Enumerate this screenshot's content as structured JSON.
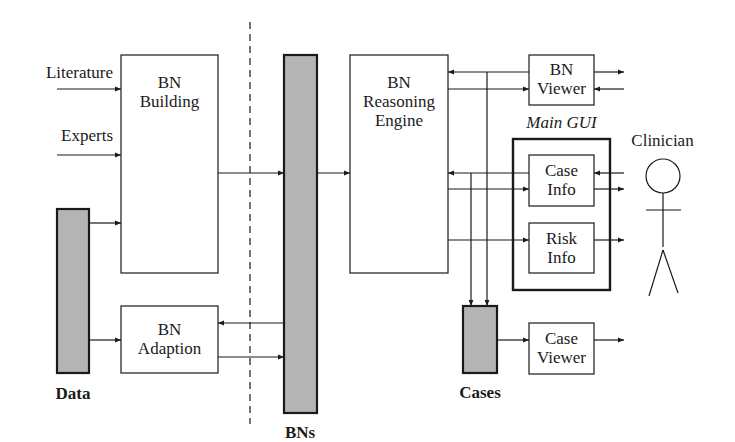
{
  "inputs": {
    "literature": "Literature",
    "experts": "Experts"
  },
  "stores": {
    "data": "Data",
    "bns": "BNs",
    "cases": "Cases"
  },
  "modules": {
    "bn_building": {
      "line1": "BN",
      "line2": "Building"
    },
    "bn_adaption": {
      "line1": "BN",
      "line2": "Adaption"
    },
    "bn_reasoning_engine": {
      "line1": "BN",
      "line2": "Reasoning",
      "line3": "Engine"
    },
    "bn_viewer": {
      "line1": "BN",
      "line2": "Viewer"
    },
    "case_info": {
      "line1": "Case",
      "line2": "Info"
    },
    "risk_info": {
      "line1": "Risk",
      "line2": "Info"
    },
    "case_viewer": {
      "line1": "Case",
      "line2": "Viewer"
    }
  },
  "groups": {
    "main_gui": "Main GUI"
  },
  "actors": {
    "clinician": "Clinician"
  },
  "colors": {
    "stroke": "#1a1a1a",
    "store_fill": "#b4b4b4",
    "background": "#ffffff"
  }
}
